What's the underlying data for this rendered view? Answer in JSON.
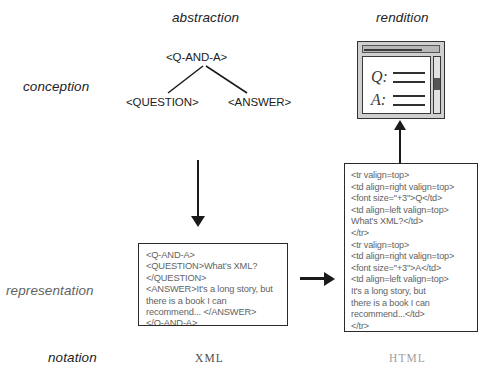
{
  "diagram": {
    "columns": [
      {
        "id": "abstraction",
        "label": "abstraction"
      },
      {
        "id": "rendition",
        "label": "rendition"
      }
    ],
    "rows": [
      {
        "id": "conception",
        "label": "conception"
      },
      {
        "id": "representation",
        "label": "representation"
      },
      {
        "id": "notation",
        "label": "notation"
      }
    ]
  },
  "tree": {
    "root": "<Q-AND-A>",
    "children": [
      "<QUESTION>",
      "<ANSWER>"
    ]
  },
  "rendition": {
    "icon_name": "browser-window-icon",
    "question_glyph": "Q:",
    "answer_glyph": "A:"
  },
  "xml_box": {
    "name": "xml-source-box",
    "code": "<Q-AND-A>\n<QUESTION>What's XML?\n</QUESTION>\n<ANSWER>It's a long story, but\nthere is a book I can\nrecommend... </ANSWER>\n</Q-AND-A>",
    "notation_label": "XML"
  },
  "html_box": {
    "name": "html-source-box",
    "code": "<tr valign=top>\n<td align=right valign=top>\n<font size=\"+3\">Q</td>\n<td align=left valign=top>\nWhat's XML?</td>\n</tr>\n<tr valign=top>\n<td align=right valign=top>\n<font size=\"+3\">A</td>\n<td align=left valign=top>\nIt's a long story, but\nthere is a book I can\nrecommend...</td>\n</tr>",
    "notation_label": "HTML"
  },
  "arrows": [
    {
      "id": "abstraction-to-xml",
      "name": "arrow-down-abstraction-to-xml",
      "direction": "down"
    },
    {
      "id": "xml-to-html",
      "name": "arrow-right-xml-to-html",
      "direction": "right"
    },
    {
      "id": "html-to-rendition",
      "name": "arrow-up-html-to-rendition",
      "direction": "up"
    }
  ],
  "colors": {
    "ink": "#1a1a1a",
    "paper": "#ffffff",
    "chrome": "#cfcfcf",
    "muted_text": "#4e4e4e"
  }
}
